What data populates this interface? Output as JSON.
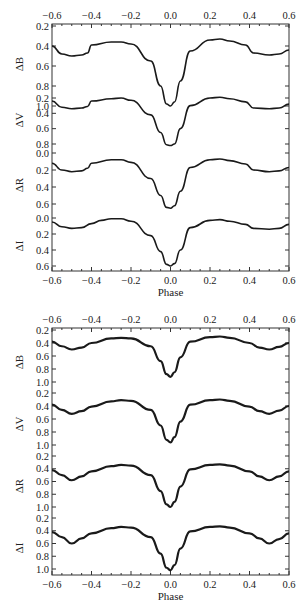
{
  "chart_data": [
    {
      "type": "line",
      "title": "",
      "xlabel": "Phase",
      "xlim": [
        -0.6,
        0.6
      ],
      "x_ticks": [
        "-0.6",
        "-0.4",
        "-0.2",
        "0.0",
        "0.2",
        "0.4",
        "0.6"
      ],
      "grid": false,
      "legend": null,
      "series": [
        {
          "name": "ΔB",
          "ylabel": "ΔB",
          "y_ticks": [
            "0.2",
            "0.4",
            "0.6",
            "0.8",
            "1.0"
          ],
          "x": [
            -0.6,
            -0.55,
            -0.5,
            -0.45,
            -0.42,
            -0.4,
            -0.3,
            -0.25,
            -0.2,
            -0.1,
            -0.05,
            -0.02,
            0.0,
            0.02,
            0.05,
            0.1,
            0.2,
            0.25,
            0.3,
            0.38,
            0.42,
            0.5,
            0.55,
            0.6
          ],
          "y": [
            0.4,
            0.48,
            0.5,
            0.49,
            0.47,
            0.39,
            0.36,
            0.36,
            0.38,
            0.55,
            0.8,
            0.98,
            1.0,
            0.96,
            0.75,
            0.45,
            0.34,
            0.33,
            0.35,
            0.39,
            0.47,
            0.49,
            0.48,
            0.44
          ]
        },
        {
          "name": "ΔV",
          "ylabel": "ΔV",
          "y_ticks": [
            "0.2",
            "0.4",
            "0.6",
            "0.8"
          ],
          "x": [
            -0.6,
            -0.55,
            -0.5,
            -0.45,
            -0.42,
            -0.4,
            -0.3,
            -0.25,
            -0.2,
            -0.1,
            -0.05,
            -0.02,
            0.0,
            0.02,
            0.05,
            0.1,
            0.2,
            0.25,
            0.3,
            0.38,
            0.42,
            0.5,
            0.55,
            0.6
          ],
          "y": [
            0.24,
            0.32,
            0.34,
            0.33,
            0.31,
            0.24,
            0.21,
            0.2,
            0.23,
            0.42,
            0.65,
            0.81,
            0.82,
            0.8,
            0.6,
            0.3,
            0.2,
            0.19,
            0.21,
            0.25,
            0.33,
            0.34,
            0.33,
            0.28
          ]
        },
        {
          "name": "ΔR",
          "ylabel": "ΔR",
          "y_ticks": [
            "0.0",
            "0.2",
            "0.4",
            "0.6"
          ],
          "x": [
            -0.6,
            -0.55,
            -0.5,
            -0.45,
            -0.42,
            -0.4,
            -0.3,
            -0.25,
            -0.2,
            -0.1,
            -0.05,
            -0.02,
            0.0,
            0.02,
            0.05,
            0.1,
            0.2,
            0.25,
            0.3,
            0.38,
            0.42,
            0.5,
            0.55,
            0.6
          ],
          "y": [
            0.12,
            0.2,
            0.22,
            0.21,
            0.18,
            0.12,
            0.08,
            0.08,
            0.11,
            0.3,
            0.5,
            0.64,
            0.65,
            0.62,
            0.45,
            0.17,
            0.08,
            0.07,
            0.09,
            0.13,
            0.2,
            0.22,
            0.21,
            0.17
          ]
        },
        {
          "name": "ΔI",
          "ylabel": "ΔI",
          "y_ticks": [
            "0.0",
            "0.2",
            "0.4",
            "0.6"
          ],
          "x": [
            -0.6,
            -0.55,
            -0.5,
            -0.45,
            -0.4,
            -0.35,
            -0.3,
            -0.25,
            -0.2,
            -0.1,
            -0.05,
            -0.02,
            0.0,
            0.02,
            0.05,
            0.1,
            0.2,
            0.25,
            0.3,
            0.38,
            0.42,
            0.5,
            0.55,
            0.6
          ],
          "y": [
            0.05,
            0.11,
            0.13,
            0.12,
            0.07,
            0.03,
            0.01,
            0.01,
            0.04,
            0.22,
            0.42,
            0.58,
            0.6,
            0.57,
            0.4,
            0.12,
            0.03,
            0.02,
            0.04,
            0.08,
            0.13,
            0.14,
            0.13,
            0.08
          ]
        }
      ]
    },
    {
      "type": "line",
      "title": "",
      "xlabel": "Phase",
      "xlim": [
        -0.6,
        0.6
      ],
      "x_ticks": [
        "-0.6",
        "-0.4",
        "-0.2",
        "0.0",
        "0.2",
        "0.4",
        "0.6"
      ],
      "grid": false,
      "legend": null,
      "series": [
        {
          "name": "ΔB",
          "ylabel": "ΔB",
          "y_ticks": [
            "0.2",
            "0.4",
            "0.6",
            "0.8",
            "1.0"
          ],
          "x": [
            -0.6,
            -0.55,
            -0.5,
            -0.45,
            -0.4,
            -0.3,
            -0.25,
            -0.2,
            -0.1,
            -0.05,
            -0.02,
            0.0,
            0.02,
            0.05,
            0.1,
            0.2,
            0.25,
            0.3,
            0.4,
            0.45,
            0.5,
            0.55,
            0.6
          ],
          "y": [
            0.38,
            0.45,
            0.5,
            0.47,
            0.4,
            0.33,
            0.32,
            0.33,
            0.45,
            0.68,
            0.88,
            0.92,
            0.85,
            0.62,
            0.38,
            0.31,
            0.3,
            0.32,
            0.4,
            0.47,
            0.5,
            0.46,
            0.4
          ]
        },
        {
          "name": "ΔV",
          "ylabel": "ΔV",
          "y_ticks": [
            "0.2",
            "0.4",
            "0.6",
            "0.8",
            "1.0"
          ],
          "x": [
            -0.6,
            -0.55,
            -0.5,
            -0.45,
            -0.4,
            -0.3,
            -0.25,
            -0.2,
            -0.1,
            -0.05,
            -0.02,
            0.0,
            0.02,
            0.05,
            0.1,
            0.2,
            0.25,
            0.3,
            0.4,
            0.45,
            0.5,
            0.55,
            0.6
          ],
          "y": [
            0.38,
            0.46,
            0.52,
            0.48,
            0.41,
            0.33,
            0.31,
            0.32,
            0.46,
            0.7,
            0.92,
            0.96,
            0.88,
            0.64,
            0.38,
            0.31,
            0.3,
            0.32,
            0.41,
            0.48,
            0.52,
            0.47,
            0.4
          ]
        },
        {
          "name": "ΔR",
          "ylabel": "ΔR",
          "y_ticks": [
            "0.2",
            "0.4",
            "0.6",
            "0.8",
            "1.0"
          ],
          "x": [
            -0.6,
            -0.55,
            -0.5,
            -0.45,
            -0.4,
            -0.3,
            -0.25,
            -0.2,
            -0.1,
            -0.05,
            -0.02,
            0.0,
            0.02,
            0.05,
            0.1,
            0.2,
            0.25,
            0.3,
            0.4,
            0.45,
            0.5,
            0.55,
            0.6
          ],
          "y": [
            0.42,
            0.5,
            0.58,
            0.52,
            0.44,
            0.36,
            0.34,
            0.35,
            0.5,
            0.75,
            0.96,
            1.0,
            0.92,
            0.68,
            0.41,
            0.34,
            0.33,
            0.35,
            0.44,
            0.52,
            0.58,
            0.52,
            0.44
          ]
        },
        {
          "name": "ΔI",
          "ylabel": "ΔI",
          "y_ticks": [
            "0.2",
            "0.4",
            "0.6",
            "0.8",
            "1.0"
          ],
          "x": [
            -0.6,
            -0.55,
            -0.5,
            -0.45,
            -0.4,
            -0.3,
            -0.25,
            -0.2,
            -0.1,
            -0.05,
            -0.02,
            0.0,
            0.02,
            0.05,
            0.1,
            0.2,
            0.25,
            0.3,
            0.4,
            0.45,
            0.5,
            0.55,
            0.6
          ],
          "y": [
            0.42,
            0.5,
            0.6,
            0.52,
            0.44,
            0.36,
            0.34,
            0.35,
            0.5,
            0.76,
            0.98,
            1.02,
            0.94,
            0.68,
            0.41,
            0.34,
            0.33,
            0.35,
            0.44,
            0.52,
            0.6,
            0.53,
            0.44
          ]
        }
      ]
    }
  ],
  "panels": [
    {
      "frame": {
        "x0": 52,
        "x1": 289,
        "y0": 24,
        "y1": 271
      },
      "series_layout": [
        {
          "label": "ΔB",
          "ymin": 0.2,
          "ymax": 1.0,
          "top": 26,
          "bottom": 106,
          "label_y": 64
        },
        {
          "label": "ΔV",
          "ymin": 0.2,
          "ymax": 0.8,
          "top": 98,
          "bottom": 144,
          "label_y": 120
        },
        {
          "label": "ΔR",
          "ymin": 0.0,
          "ymax": 0.6,
          "top": 153,
          "bottom": 204,
          "label_y": 185
        },
        {
          "label": "ΔI",
          "ymin": 0.0,
          "ymax": 0.6,
          "top": 218,
          "bottom": 266,
          "label_y": 246
        }
      ]
    },
    {
      "frame": {
        "x0": 52,
        "x1": 289,
        "y0": 328,
        "y1": 575
      },
      "series_layout": [
        {
          "label": "ΔB",
          "ymin": 0.2,
          "ymax": 1.0,
          "top": 330,
          "bottom": 382,
          "label_y": 362
        },
        {
          "label": "ΔV",
          "ymin": 0.2,
          "ymax": 1.0,
          "top": 393,
          "bottom": 445,
          "label_y": 424
        },
        {
          "label": "ΔR",
          "ymin": 0.2,
          "ymax": 1.0,
          "top": 456,
          "bottom": 507,
          "label_y": 486
        },
        {
          "label": "ΔI",
          "ymin": 0.2,
          "ymax": 1.0,
          "top": 518,
          "bottom": 569,
          "label_y": 548
        }
      ]
    }
  ],
  "colors": {
    "line": "#1a1a1a",
    "axis": "#333333",
    "background": "#ffffff"
  }
}
